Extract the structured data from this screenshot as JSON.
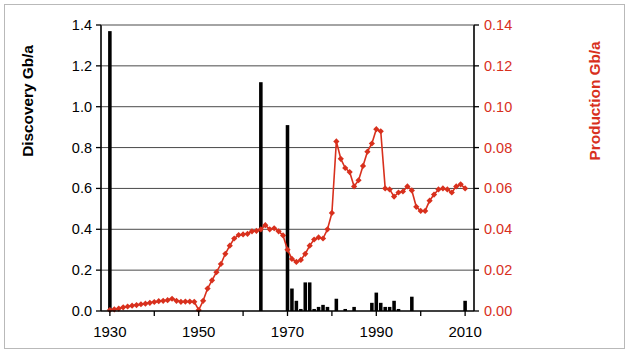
{
  "figure": {
    "background": "#ffffff",
    "frame_color": "#b9b9b9"
  },
  "axis_labels": {
    "left": "Discovery Gb/a",
    "right": "Production Gb/a",
    "left_color": "#000000",
    "right_color": "#d8301d"
  },
  "chart_data": {
    "type": "bar",
    "title": "",
    "subtitle": "",
    "xlabel": "",
    "ylabel": "Discovery Gb/a",
    "y2label": "Production Gb/a",
    "xlim": [
      1928,
      2012
    ],
    "ylim": [
      0.0,
      1.4
    ],
    "y2lim": [
      0.0,
      0.14
    ],
    "grid": true,
    "grid_axis": "y",
    "legend": "none",
    "x_ticks_major": [
      1930,
      1950,
      1970,
      1990,
      2010
    ],
    "x_ticks_minor": [
      1940,
      1960,
      1980,
      2000
    ],
    "x_tick_labels": [
      "1930",
      "1950",
      "1970",
      "1990",
      "2010"
    ],
    "y_ticks": [
      0.0,
      0.2,
      0.4,
      0.6,
      0.8,
      1.0,
      1.2,
      1.4
    ],
    "y_tick_labels": [
      "0.0",
      "0.2",
      "0.4",
      "0.6",
      "0.8",
      "1.0",
      "1.2",
      "1.4"
    ],
    "y2_ticks": [
      0.0,
      0.02,
      0.04,
      0.06,
      0.08,
      0.1,
      0.12,
      0.14
    ],
    "y2_tick_labels": [
      "0.00",
      "0.02",
      "0.04",
      "0.06",
      "0.08",
      "0.10",
      "0.12",
      "0.14"
    ],
    "series": [
      {
        "name": "Discovery",
        "type": "bar",
        "axis": "left",
        "color": "#000000",
        "unit": "Gb/a",
        "x": [
          1930,
          1931,
          1932,
          1933,
          1934,
          1935,
          1936,
          1937,
          1938,
          1939,
          1940,
          1941,
          1942,
          1943,
          1944,
          1945,
          1946,
          1947,
          1948,
          1949,
          1950,
          1951,
          1952,
          1953,
          1954,
          1955,
          1956,
          1957,
          1958,
          1959,
          1960,
          1961,
          1962,
          1963,
          1964,
          1965,
          1966,
          1967,
          1968,
          1969,
          1970,
          1971,
          1972,
          1973,
          1974,
          1975,
          1976,
          1977,
          1978,
          1979,
          1980,
          1981,
          1982,
          1983,
          1984,
          1985,
          1986,
          1987,
          1988,
          1989,
          1990,
          1991,
          1992,
          1993,
          1994,
          1995,
          1996,
          1997,
          1998,
          1999,
          2000,
          2001,
          2002,
          2003,
          2004,
          2005,
          2006,
          2007,
          2008,
          2009,
          2010
        ],
        "values": [
          1.37,
          0.0,
          0.0,
          0.0,
          0.0,
          0.0,
          0.0,
          0.0,
          0.0,
          0.0,
          0.0,
          0.0,
          0.0,
          0.0,
          0.0,
          0.0,
          0.0,
          0.0,
          0.0,
          0.0,
          0.0,
          0.0,
          0.0,
          0.0,
          0.0,
          0.0,
          0.0,
          0.0,
          0.0,
          0.0,
          0.0,
          0.0,
          0.0,
          0.0,
          1.12,
          0.0,
          0.0,
          0.0,
          0.0,
          0.0,
          0.91,
          0.11,
          0.05,
          0.01,
          0.14,
          0.14,
          0.01,
          0.02,
          0.03,
          0.02,
          0.0,
          0.06,
          0.0,
          0.01,
          0.0,
          0.02,
          0.0,
          0.0,
          0.0,
          0.04,
          0.09,
          0.04,
          0.02,
          0.02,
          0.05,
          0.01,
          0.0,
          0.0,
          0.07,
          0.0,
          0.0,
          0.0,
          0.0,
          0.0,
          0.0,
          0.0,
          0.0,
          0.0,
          0.0,
          0.0,
          0.05
        ]
      },
      {
        "name": "Production",
        "type": "line-markers",
        "axis": "right",
        "color": "#d8301d",
        "marker": "diamond",
        "unit": "Gb/a",
        "x": [
          1930,
          1931,
          1932,
          1933,
          1934,
          1935,
          1936,
          1937,
          1938,
          1939,
          1940,
          1941,
          1942,
          1943,
          1944,
          1945,
          1946,
          1947,
          1948,
          1949,
          1950,
          1951,
          1952,
          1953,
          1954,
          1955,
          1956,
          1957,
          1958,
          1959,
          1960,
          1961,
          1962,
          1963,
          1964,
          1965,
          1966,
          1967,
          1968,
          1969,
          1970,
          1971,
          1972,
          1973,
          1974,
          1975,
          1976,
          1977,
          1978,
          1979,
          1980,
          1981,
          1982,
          1983,
          1984,
          1985,
          1986,
          1987,
          1988,
          1989,
          1990,
          1991,
          1992,
          1993,
          1994,
          1995,
          1996,
          1997,
          1998,
          1999,
          2000,
          2001,
          2002,
          2003,
          2004,
          2005,
          2006,
          2007,
          2008,
          2009,
          2010
        ],
        "values": [
          0.0005,
          0.0008,
          0.0012,
          0.0018,
          0.0022,
          0.0026,
          0.0029,
          0.0033,
          0.0036,
          0.004,
          0.0044,
          0.0048,
          0.005,
          0.0053,
          0.006,
          0.005,
          0.0045,
          0.0046,
          0.0046,
          0.0045,
          0.0005,
          0.005,
          0.011,
          0.015,
          0.019,
          0.023,
          0.028,
          0.032,
          0.0355,
          0.0372,
          0.0375,
          0.0378,
          0.039,
          0.0392,
          0.04,
          0.042,
          0.04,
          0.0405,
          0.039,
          0.037,
          0.03,
          0.0255,
          0.024,
          0.025,
          0.028,
          0.032,
          0.035,
          0.036,
          0.0355,
          0.04,
          0.048,
          0.083,
          0.0745,
          0.07,
          0.068,
          0.061,
          0.064,
          0.071,
          0.078,
          0.082,
          0.089,
          0.088,
          0.06,
          0.0595,
          0.056,
          0.058,
          0.0585,
          0.061,
          0.059,
          0.051,
          0.049,
          0.049,
          0.054,
          0.057,
          0.0595,
          0.06,
          0.0595,
          0.058,
          0.061,
          0.062,
          0.06
        ]
      }
    ]
  }
}
